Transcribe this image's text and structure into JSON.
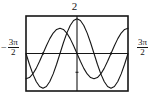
{
  "figure": {
    "name": "trigonometric-graph",
    "background": "#ffffff",
    "ink": "#161616",
    "frame": {
      "x": 26,
      "y": 16,
      "width": 102,
      "height": 75,
      "stroke": "#161616",
      "stroke_width": 1.6
    }
  },
  "labels": {
    "top": "2",
    "left_minus": "−",
    "left_numerator": "3π",
    "left_denominator": "2",
    "right_numerator": "3π",
    "right_denominator": "2"
  },
  "chart_data": {
    "type": "line",
    "title": "",
    "xlabel": "",
    "ylabel": "",
    "xlim": [
      -4.71238898,
      4.71238898
    ],
    "ylim": [
      -2,
      2
    ],
    "xlim_label_left": "-3π/2",
    "xlim_label_right": "3π/2",
    "ylim_label_top": "2",
    "grid": false,
    "legend": "none",
    "axes": {
      "x_axis_at_y": 0,
      "y_axis_at_x": 0,
      "x_ticks": [
        -3.14159265,
        3.14159265
      ],
      "y_ticks": [
        -1
      ],
      "tick_length_px": 3
    },
    "series": [
      {
        "name": "curve-a",
        "expression": "1.85*cos(x)",
        "color": "#161616",
        "stroke_width": 1.1,
        "x": [
          -4.712389,
          -4.39823,
          -4.08407,
          -3.769911,
          -3.455752,
          -3.141593,
          -2.827433,
          -2.513274,
          -2.199115,
          -1.884956,
          -1.570796,
          -1.256637,
          -0.942478,
          -0.628319,
          -0.314159,
          0.0,
          0.314159,
          0.628319,
          0.942478,
          1.256637,
          1.570796,
          1.884956,
          2.199115,
          2.513274,
          2.827433,
          3.141593,
          3.455752,
          3.769911,
          4.08407,
          4.39823,
          4.712389
        ],
        "y": [
          0.0,
          -0.5716,
          -1.0876,
          -1.4965,
          -1.7592,
          -1.85,
          -1.7592,
          -1.4965,
          -1.0876,
          -0.5716,
          0.0,
          0.5716,
          1.0876,
          1.4965,
          1.7592,
          1.85,
          1.7592,
          1.4965,
          1.0876,
          0.5716,
          0.0,
          -0.5716,
          -1.0876,
          -1.4965,
          -1.7592,
          -1.85,
          -1.7592,
          -1.4965,
          -1.0876,
          -0.5716,
          0.0
        ]
      },
      {
        "name": "curve-b",
        "expression": "-1.35*sin(x)",
        "color": "#161616",
        "stroke_width": 1.1,
        "x": [
          -4.712389,
          -4.39823,
          -4.08407,
          -3.769911,
          -3.455752,
          -3.141593,
          -2.827433,
          -2.513274,
          -2.199115,
          -1.884956,
          -1.570796,
          -1.256637,
          -0.942478,
          -0.628319,
          -0.314159,
          0.0,
          0.314159,
          0.628319,
          0.942478,
          1.256637,
          1.570796,
          1.884956,
          2.199115,
          2.513274,
          2.827433,
          3.141593,
          3.455752,
          3.769911,
          4.08407,
          4.39823,
          4.712389
        ],
        "y": [
          -1.35,
          -1.284,
          -1.0921,
          -0.7935,
          -0.4172,
          0.0,
          0.4172,
          0.7935,
          1.0921,
          1.284,
          1.35,
          1.284,
          1.0921,
          0.7935,
          0.4172,
          0.0,
          -0.4172,
          -0.7935,
          -1.0921,
          -1.284,
          -1.35,
          -1.284,
          -1.0921,
          -0.7935,
          -0.4172,
          0.0,
          0.4172,
          0.7935,
          1.0921,
          1.284,
          1.35
        ]
      }
    ]
  }
}
